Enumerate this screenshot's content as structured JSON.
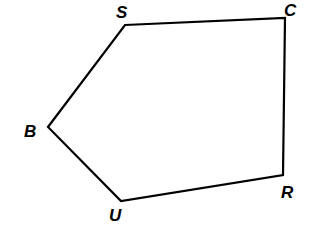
{
  "diagram": {
    "type": "pentagon",
    "stroke_color": "#000000",
    "background": "#ffffff",
    "vertices": [
      {
        "name": "S",
        "x": 125,
        "y": 25,
        "label_x": 116,
        "label_y": 18
      },
      {
        "name": "C",
        "x": 285,
        "y": 18,
        "label_x": 284,
        "label_y": 16
      },
      {
        "name": "R",
        "x": 283,
        "y": 175,
        "label_x": 281,
        "label_y": 198
      },
      {
        "name": "U",
        "x": 121,
        "y": 201,
        "label_x": 109,
        "label_y": 221
      },
      {
        "name": "B",
        "x": 48,
        "y": 127,
        "label_x": 24,
        "label_y": 137
      }
    ],
    "edges": [
      [
        "S",
        "C"
      ],
      [
        "C",
        "R"
      ],
      [
        "R",
        "U"
      ],
      [
        "U",
        "B"
      ],
      [
        "B",
        "S"
      ]
    ]
  }
}
